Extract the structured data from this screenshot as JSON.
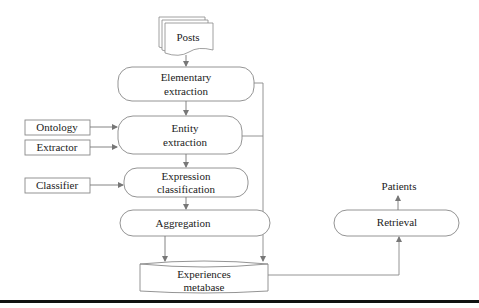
{
  "diagram": {
    "nodes": {
      "posts": {
        "label": "Posts",
        "shape": "document-stack"
      },
      "elementary": {
        "line1": "Elementary",
        "line2": "extraction",
        "shape": "rounded-rect"
      },
      "entity": {
        "line1": "Entity",
        "line2": "extraction",
        "shape": "rounded-rect"
      },
      "expression": {
        "line1": "Expression",
        "line2": "classification",
        "shape": "rounded-rect"
      },
      "aggregation": {
        "label": "Aggregation",
        "shape": "rounded-rect"
      },
      "metabase": {
        "line1": "Experiences",
        "line2": "metabase",
        "shape": "cylinder"
      },
      "retrieval": {
        "label": "Retrieval",
        "shape": "rounded-rect"
      },
      "patients": {
        "label": "Patients",
        "shape": "text"
      },
      "ontology": {
        "label": "Ontology",
        "shape": "rect"
      },
      "extractor": {
        "label": "Extractor",
        "shape": "rect"
      },
      "classifier": {
        "label": "Classifier",
        "shape": "rect"
      }
    },
    "edges": [
      {
        "from": "Posts",
        "to": "Elementary extraction"
      },
      {
        "from": "Elementary extraction",
        "to": "Entity extraction"
      },
      {
        "from": "Ontology",
        "to": "Entity extraction"
      },
      {
        "from": "Extractor",
        "to": "Entity extraction"
      },
      {
        "from": "Entity extraction",
        "to": "Expression classification"
      },
      {
        "from": "Classifier",
        "to": "Expression classification"
      },
      {
        "from": "Expression classification",
        "to": "Aggregation"
      },
      {
        "from": "Aggregation",
        "to": "Experiences metabase"
      },
      {
        "from": "Elementary extraction",
        "to": "Experiences metabase"
      },
      {
        "from": "Entity extraction",
        "to": "Experiences metabase"
      },
      {
        "from": "Experiences metabase",
        "to": "Retrieval"
      },
      {
        "from": "Retrieval",
        "to": "Patients"
      }
    ],
    "colors": {
      "stroke": "#777777",
      "text": "#222222",
      "rule": "#111111"
    }
  }
}
